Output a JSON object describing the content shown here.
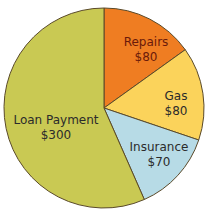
{
  "chart_data": {
    "type": "pie",
    "title": "",
    "total": 530,
    "slices": [
      {
        "label": "Repairs",
        "value": 80,
        "display": "$80",
        "color": "#ef7d22"
      },
      {
        "label": "Gas",
        "value": 80,
        "display": "$80",
        "color": "#fbd35b"
      },
      {
        "label": "Insurance",
        "value": 70,
        "display": "$70",
        "color": "#b7dbe6"
      },
      {
        "label": "Loan Payment",
        "value": 300,
        "display": "$300",
        "color": "#c9c953"
      }
    ],
    "start_angle_deg": 0,
    "direction": "clockwise",
    "border_color": "#5a4a2a"
  },
  "labels": {
    "repairs": {
      "name": "Repairs",
      "value": "$80"
    },
    "gas": {
      "name": "Gas",
      "value": "$80"
    },
    "insurance": {
      "name": "Insurance",
      "value": "$70"
    },
    "loan": {
      "name": "Loan Payment",
      "value": "$300"
    }
  }
}
